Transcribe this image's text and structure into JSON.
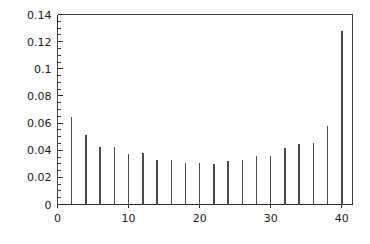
{
  "chart_data": {
    "type": "bar",
    "title": "",
    "subtitle": "",
    "xlabel": "",
    "ylabel": "",
    "xlim": [
      0,
      41.5
    ],
    "ylim": [
      0,
      0.14
    ],
    "grid": false,
    "legend": null,
    "style": "stem-plot",
    "marker_color": "#4a4a4a",
    "axis_color": "#2b2b2b",
    "background_color": "#ffffff",
    "x": [
      0,
      2,
      4,
      6,
      8,
      10,
      12,
      14,
      16,
      18,
      20,
      22,
      24,
      26,
      28,
      30,
      32,
      34,
      36,
      38,
      40
    ],
    "values": [
      0.128,
      0.0645,
      0.0515,
      0.0425,
      0.0425,
      0.037,
      0.038,
      0.0325,
      0.0325,
      0.0305,
      0.0305,
      0.0295,
      0.032,
      0.0325,
      0.036,
      0.0355,
      0.0415,
      0.0445,
      0.045,
      0.0575,
      0.128
    ],
    "categories": [
      "0",
      "2",
      "4",
      "6",
      "8",
      "10",
      "12",
      "14",
      "16",
      "18",
      "20",
      "22",
      "24",
      "26",
      "28",
      "30",
      "32",
      "34",
      "36",
      "38",
      "40"
    ],
    "x_ticks": [
      0,
      10,
      20,
      30,
      40
    ],
    "x_tick_labels": [
      "0",
      "10",
      "20",
      "30",
      "40"
    ],
    "x_minor_step": 2,
    "y_ticks": [
      0,
      0.02,
      0.04,
      0.06,
      0.08,
      0.1,
      0.12,
      0.14
    ],
    "y_tick_labels": [
      "0",
      "0.02",
      "0.04",
      "0.06",
      "0.08",
      "0.1",
      "0.12",
      "0.14"
    ],
    "y_minor_step": 0.005
  }
}
